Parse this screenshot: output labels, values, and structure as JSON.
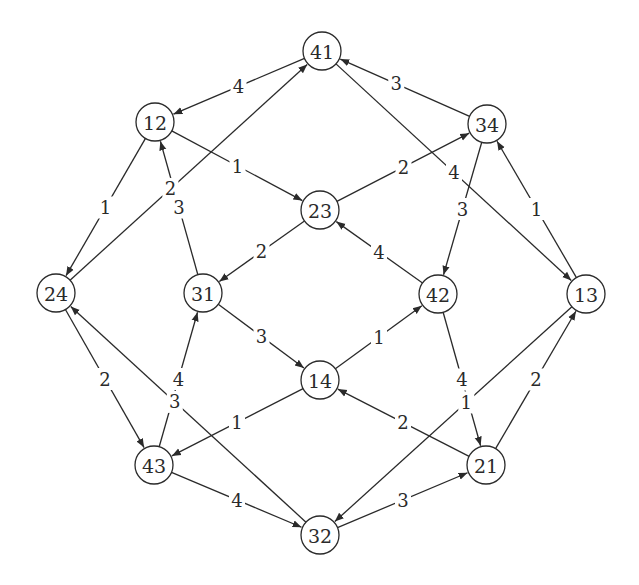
{
  "diagram": {
    "type": "directed-weighted-graph",
    "node_radius": 19,
    "colors": {
      "stroke": "#2a2a2a",
      "background": "#ffffff"
    },
    "nodes": [
      {
        "id": "41",
        "label": "41",
        "x": 322,
        "y": 51
      },
      {
        "id": "12",
        "label": "12",
        "x": 155,
        "y": 122
      },
      {
        "id": "34",
        "label": "34",
        "x": 487,
        "y": 124
      },
      {
        "id": "23",
        "label": "23",
        "x": 320,
        "y": 210
      },
      {
        "id": "24",
        "label": "24",
        "x": 56,
        "y": 293
      },
      {
        "id": "31",
        "label": "31",
        "x": 203,
        "y": 293
      },
      {
        "id": "42",
        "label": "42",
        "x": 438,
        "y": 294
      },
      {
        "id": "13",
        "label": "13",
        "x": 586,
        "y": 294
      },
      {
        "id": "14",
        "label": "14",
        "x": 320,
        "y": 380
      },
      {
        "id": "43",
        "label": "43",
        "x": 154,
        "y": 465
      },
      {
        "id": "21",
        "label": "21",
        "x": 486,
        "y": 465
      },
      {
        "id": "32",
        "label": "32",
        "x": 320,
        "y": 535
      }
    ],
    "edges": [
      {
        "from": "41",
        "to": "12",
        "label": "4",
        "t": 0.5
      },
      {
        "from": "24",
        "to": "41",
        "label": "2",
        "t": 0.43
      },
      {
        "from": "34",
        "to": "41",
        "label": "3",
        "t": 0.55
      },
      {
        "from": "41",
        "to": "13",
        "label": "4",
        "t": 0.5
      },
      {
        "from": "12",
        "to": "23",
        "label": "1",
        "t": 0.5
      },
      {
        "from": "12",
        "to": "24",
        "label": "1",
        "t": 0.5
      },
      {
        "from": "31",
        "to": "12",
        "label": "3",
        "t": 0.5
      },
      {
        "from": "23",
        "to": "34",
        "label": "2",
        "t": 0.5
      },
      {
        "from": "34",
        "to": "42",
        "label": "3",
        "t": 0.5
      },
      {
        "from": "13",
        "to": "34",
        "label": "1",
        "t": 0.5
      },
      {
        "from": "23",
        "to": "31",
        "label": "2",
        "t": 0.5
      },
      {
        "from": "42",
        "to": "23",
        "label": "4",
        "t": 0.5
      },
      {
        "from": "31",
        "to": "14",
        "label": "3",
        "t": 0.5
      },
      {
        "from": "43",
        "to": "31",
        "label": "4",
        "t": 0.5
      },
      {
        "from": "14",
        "to": "42",
        "label": "1",
        "t": 0.5
      },
      {
        "from": "42",
        "to": "21",
        "label": "4",
        "t": 0.5
      },
      {
        "from": "24",
        "to": "43",
        "label": "2",
        "t": 0.5
      },
      {
        "from": "32",
        "to": "24",
        "label": "3",
        "t": 0.55
      },
      {
        "from": "14",
        "to": "43",
        "label": "1",
        "t": 0.5
      },
      {
        "from": "21",
        "to": "14",
        "label": "2",
        "t": 0.5
      },
      {
        "from": "43",
        "to": "32",
        "label": "4",
        "t": 0.5
      },
      {
        "from": "32",
        "to": "21",
        "label": "3",
        "t": 0.5
      },
      {
        "from": "13",
        "to": "32",
        "label": "1",
        "t": 0.45
      },
      {
        "from": "21",
        "to": "13",
        "label": "2",
        "t": 0.5
      }
    ]
  }
}
